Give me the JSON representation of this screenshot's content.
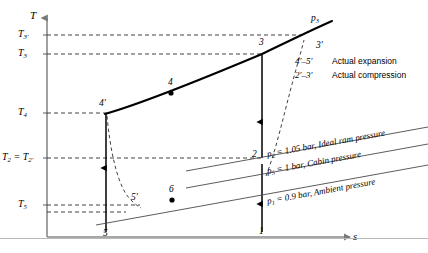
{
  "figure": {
    "kind": "T-s diagram",
    "axes": {
      "y_label": "T",
      "x_label": "s"
    },
    "temperature_ticks": [
      {
        "id": "T3p",
        "label": "T3′",
        "y": 35
      },
      {
        "id": "T3",
        "label": "T3",
        "y": 54
      },
      {
        "id": "T4",
        "label": "T4",
        "y": 113
      },
      {
        "id": "T2",
        "label": "T2 = T2′",
        "y": 158
      },
      {
        "id": "T5",
        "label": "T5",
        "y": 205
      }
    ],
    "state_points": [
      {
        "id": "p3prime",
        "label": "3′",
        "x": 318,
        "y": 47
      },
      {
        "id": "p3",
        "label": "3",
        "x": 264,
        "y": 46
      },
      {
        "id": "p4",
        "label": "4",
        "x": 171,
        "y": 84
      },
      {
        "id": "p4prime",
        "label": "4′",
        "x": 106,
        "y": 105
      },
      {
        "id": "p2",
        "label": "2",
        "x": 260,
        "y": 155
      },
      {
        "id": "p5prime",
        "label": "5′",
        "x": 134,
        "y": 199
      },
      {
        "id": "p6",
        "label": "6",
        "x": 172,
        "y": 190
      },
      {
        "id": "p5",
        "label": "5",
        "x": 106,
        "y": 228
      },
      {
        "id": "p1",
        "label": "1",
        "x": 262,
        "y": 228
      }
    ],
    "curve_labels": [
      {
        "id": "p3curve",
        "label": "p3",
        "x": 312,
        "y": 20
      }
    ],
    "pressure_lines": [
      {
        "id": "p2line",
        "label": "p2 = 1.05 bar, Ideal ram pressure"
      },
      {
        "id": "p5line",
        "label": "p5 = 1 bar, Cabin pressure"
      },
      {
        "id": "p1line",
        "label": "p1 = 0.9 bar, Ambient pressure"
      }
    ],
    "legend": [
      {
        "code": "4′–5′",
        "text": "Actual expansion"
      },
      {
        "code": "2′–3′",
        "text": "Actual compression"
      }
    ],
    "colors": {
      "ink": "#000000",
      "axis": "#808080",
      "dashed": "#404040",
      "rule": "#b9b9b9"
    }
  },
  "chart_data": {
    "type": "line",
    "title": "",
    "xlabel": "s",
    "ylabel": "T",
    "grid": false,
    "legend_position": "top-right",
    "annotations": [
      "p3",
      "p2 = 1.05 bar, Ideal ram pressure",
      "p5 = 1 bar, Cabin pressure",
      "p1 = 0.9 bar, Ambient pressure",
      "4′–5′ Actual expansion",
      "2′–3′ Actual compression"
    ],
    "tick_labels": {
      "y": [
        "T5",
        "T2 = T2′",
        "T4",
        "T3",
        "T3′"
      ],
      "x": []
    },
    "points": [
      {
        "name": "1",
        "s": 262,
        "T": 222
      },
      {
        "name": "2",
        "s": 262,
        "T": 158
      },
      {
        "name": "3",
        "s": 262,
        "T": 54
      },
      {
        "name": "3′",
        "s": 303,
        "T": 35
      },
      {
        "name": "4",
        "s": 172,
        "T": 93
      },
      {
        "name": "4′",
        "s": 106,
        "T": 113
      },
      {
        "name": "5",
        "s": 106,
        "T": 212
      },
      {
        "name": "5′",
        "s": 137,
        "T": 206
      },
      {
        "name": "6",
        "s": 172,
        "T": 200
      }
    ],
    "series": [
      {
        "name": "p3 isobar (ideal heat rejection 3-4)",
        "style": "solid-thick",
        "x": [
          106,
          172,
          262,
          303,
          330
        ],
        "y": [
          113,
          93,
          54,
          35,
          26
        ]
      },
      {
        "name": "ideal compression 1-2-3",
        "style": "solid-arrow",
        "x": [
          262,
          262,
          262
        ],
        "y": [
          222,
          158,
          54
        ]
      },
      {
        "name": "ideal expansion 4'-5",
        "style": "solid-arrow",
        "x": [
          106,
          106
        ],
        "y": [
          113,
          230
        ]
      },
      {
        "name": "actual compression 2'-3'",
        "style": "dashed",
        "x": [
          268,
          283,
          298,
          303
        ],
        "y": [
          170,
          120,
          70,
          48
        ]
      },
      {
        "name": "actual expansion 4'-5'",
        "style": "dashed",
        "x": [
          106,
          112,
          124,
          140
        ],
        "y": [
          115,
          150,
          185,
          205
        ]
      },
      {
        "name": "p2 isobar",
        "style": "solid-thin",
        "x": [
          160,
          418
        ],
        "y": [
          176,
          130
        ]
      },
      {
        "name": "p5 isobar",
        "style": "solid-thin",
        "x": [
          160,
          418
        ],
        "y": [
          192,
          146
        ]
      },
      {
        "name": "p1 isobar",
        "style": "solid-thin",
        "x": [
          98,
          418
        ],
        "y": [
          225,
          168
        ]
      }
    ]
  }
}
